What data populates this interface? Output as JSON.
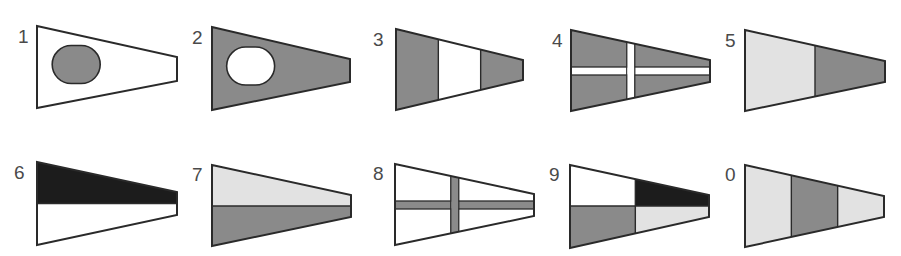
{
  "colors": {
    "white": "#ffffff",
    "grey": "#8a8a8a",
    "light_grey": "#e2e2e2",
    "black": "#1c1c1c",
    "outline": "#2a2a2a",
    "label": "#4a4a4a"
  },
  "pennants": [
    {
      "label": "1",
      "design": "white field, grey oval",
      "x": 37,
      "y": 26,
      "w": 140,
      "h": 82,
      "fly_top": 31,
      "fly_bottom": 55,
      "pattern": "disc",
      "field": "white",
      "disc": "grey",
      "label_x": 18,
      "label_y": 27
    },
    {
      "label": "2",
      "design": "grey field, white oval",
      "x": 212,
      "y": 27,
      "w": 138,
      "h": 83,
      "fly_top": 32,
      "fly_bottom": 55,
      "pattern": "disc",
      "field": "grey",
      "disc": "white",
      "label_x": 192,
      "label_y": 28
    },
    {
      "label": "3",
      "design": "vertical bands grey-white-grey",
      "x": 396,
      "y": 29,
      "w": 127,
      "h": 81,
      "fly_top": 31,
      "fly_bottom": 51,
      "pattern": "vbands",
      "bands": [
        "grey",
        "white",
        "grey"
      ],
      "label_x": 373,
      "label_y": 30
    },
    {
      "label": "4",
      "design": "grey field, white cross",
      "x": 571,
      "y": 30,
      "w": 139,
      "h": 81,
      "fly_top": 30,
      "fly_bottom": 52,
      "pattern": "cross",
      "field": "grey",
      "cross": "white",
      "label_x": 552,
      "label_y": 31
    },
    {
      "label": "5",
      "design": "light grey hoist, grey fly",
      "x": 745,
      "y": 30,
      "w": 140,
      "h": 81,
      "fly_top": 31,
      "fly_bottom": 52,
      "pattern": "vbands",
      "bands": [
        "light_grey",
        "grey"
      ],
      "label_x": 725,
      "label_y": 31
    },
    {
      "label": "6",
      "design": "black over white",
      "x": 37,
      "y": 162,
      "w": 140,
      "h": 83,
      "fly_top": 30,
      "fly_bottom": 53,
      "pattern": "hbands",
      "bands": [
        "black",
        "white"
      ],
      "label_x": 14,
      "label_y": 163
    },
    {
      "label": "7",
      "design": "light grey over grey",
      "x": 212,
      "y": 165,
      "w": 139,
      "h": 81,
      "fly_top": 30,
      "fly_bottom": 52,
      "pattern": "hbands",
      "bands": [
        "light_grey",
        "grey"
      ],
      "label_x": 192,
      "label_y": 165
    },
    {
      "label": "8",
      "design": "white field, grey cross",
      "x": 395,
      "y": 164,
      "w": 139,
      "h": 81,
      "fly_top": 30,
      "fly_bottom": 52,
      "pattern": "cross",
      "field": "white",
      "cross": "grey",
      "label_x": 373,
      "label_y": 164
    },
    {
      "label": "9",
      "design": "quartered: white, black, grey, light grey",
      "x": 570,
      "y": 165,
      "w": 139,
      "h": 83,
      "fly_top": 30,
      "fly_bottom": 52,
      "pattern": "quarters",
      "quarters": [
        "white",
        "black",
        "grey",
        "light_grey"
      ],
      "label_x": 549,
      "label_y": 165
    },
    {
      "label": "0",
      "design": "vertical bands light grey-grey-light grey",
      "x": 745,
      "y": 165,
      "w": 139,
      "h": 82,
      "fly_top": 31,
      "fly_bottom": 52,
      "pattern": "vbands",
      "bands": [
        "light_grey",
        "grey",
        "light_grey"
      ],
      "label_x": 725,
      "label_y": 165
    }
  ]
}
